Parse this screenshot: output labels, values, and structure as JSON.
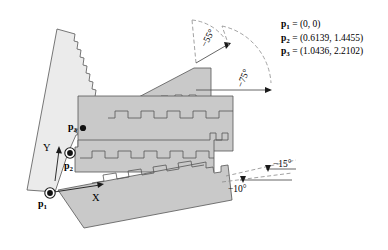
{
  "figure": {
    "background": "#ffffff",
    "width": 388,
    "height": 250
  },
  "colors": {
    "link_light": "#ebebeb",
    "link_mid": "#c9c9c9",
    "link_dark": "#bdbdbd",
    "outline": "#555555",
    "text": "#000000",
    "dashed": "#8a8a8a"
  },
  "legend": {
    "rows": [
      {
        "symbol": "p",
        "subscript": "1",
        "equals": "=",
        "value": "(0, 0)"
      },
      {
        "symbol": "p",
        "subscript": "2",
        "equals": "=",
        "value": "(0.6139, 1.4455)"
      },
      {
        "symbol": "p",
        "subscript": "3",
        "equals": "=",
        "value": "(1.0436, 2.2102)"
      }
    ]
  },
  "points": [
    {
      "id": "p1",
      "symbol": "p",
      "subscript": "1",
      "marker": "circle-dot",
      "x": 50,
      "y": 193
    },
    {
      "id": "p2",
      "symbol": "p",
      "subscript": "2",
      "marker": "circle-dot",
      "x": 70,
      "y": 153
    },
    {
      "id": "p3",
      "symbol": "p",
      "subscript": "3",
      "marker": "dot",
      "x": 83,
      "y": 128
    }
  ],
  "axes": [
    {
      "id": "y-axis",
      "label": "Y"
    },
    {
      "id": "x-axis",
      "label": "X"
    }
  ],
  "angles": [
    {
      "id": "angle-55",
      "label": "−55°",
      "value": -55,
      "unit": "degrees",
      "arc": "upper-left"
    },
    {
      "id": "angle-75",
      "label": "−75°",
      "value": -75,
      "unit": "degrees",
      "arc": "upper-right"
    },
    {
      "id": "angle-15",
      "label": "−15°",
      "value": -15,
      "unit": "degrees",
      "arc": "lower-upper"
    },
    {
      "id": "angle-10",
      "label": "−10°",
      "value": -10,
      "unit": "degrees",
      "arc": "lower-lower"
    }
  ]
}
